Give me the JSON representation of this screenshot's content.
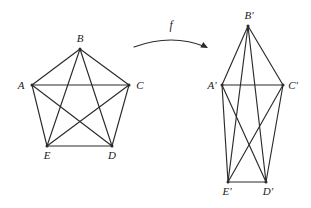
{
  "figure": {
    "type": "graph-isomorphism-diagram",
    "background_color": "#ffffff",
    "stroke_color": "#2b2b2b",
    "label_color": "#1a1a1a"
  },
  "mapping": {
    "label": "f",
    "arrow_name": "curved-mapping-arrow",
    "direction": "left-to-right",
    "curve": {
      "start_x": 134,
      "start_y": 47,
      "control_x": 172,
      "control_y": 33,
      "end_x": 206,
      "end_y": 47
    },
    "head": {
      "x": 208,
      "y": 48,
      "angle_deg": 28
    },
    "label_x": 171,
    "label_y": 29
  },
  "left_graph": {
    "name": "pentagon-complete-graph-K5",
    "vertices": [
      {
        "id": "A",
        "label": "A",
        "x": 32,
        "y": 85,
        "label_x": 21,
        "label_y": 89
      },
      {
        "id": "B",
        "label": "B",
        "x": 80,
        "y": 49,
        "label_x": 80,
        "label_y": 42
      },
      {
        "id": "C",
        "label": "C",
        "x": 129,
        "y": 85,
        "label_x": 140,
        "label_y": 89
      },
      {
        "id": "D",
        "label": "D",
        "x": 112,
        "y": 146,
        "label_x": 112,
        "label_y": 159
      },
      {
        "id": "E",
        "label": "E",
        "x": 47,
        "y": 146,
        "label_x": 47,
        "label_y": 159
      }
    ],
    "edges": [
      [
        "A",
        "B"
      ],
      [
        "B",
        "C"
      ],
      [
        "C",
        "D"
      ],
      [
        "D",
        "E"
      ],
      [
        "E",
        "A"
      ],
      [
        "A",
        "C"
      ],
      [
        "A",
        "D"
      ],
      [
        "B",
        "D"
      ],
      [
        "B",
        "E"
      ],
      [
        "C",
        "E"
      ]
    ]
  },
  "right_graph": {
    "name": "elongated-complete-graph-K5",
    "vertices": [
      {
        "id": "A'",
        "label": "A'",
        "x": 222,
        "y": 85,
        "label_x": 212,
        "label_y": 89
      },
      {
        "id": "B'",
        "label": "B'",
        "x": 248,
        "y": 26,
        "label_x": 249,
        "label_y": 19
      },
      {
        "id": "C'",
        "label": "C'",
        "x": 283,
        "y": 85,
        "label_x": 293,
        "label_y": 89
      },
      {
        "id": "D'",
        "label": "D'",
        "x": 266,
        "y": 182,
        "label_x": 268,
        "label_y": 195
      },
      {
        "id": "E'",
        "label": "E'",
        "x": 228,
        "y": 182,
        "label_x": 227,
        "label_y": 195
      }
    ],
    "edges": [
      [
        "A'",
        "B'"
      ],
      [
        "B'",
        "C'"
      ],
      [
        "C'",
        "D'"
      ],
      [
        "D'",
        "E'"
      ],
      [
        "E'",
        "A'"
      ],
      [
        "A'",
        "C'"
      ],
      [
        "A'",
        "D'"
      ],
      [
        "B'",
        "D'"
      ],
      [
        "B'",
        "E'"
      ],
      [
        "C'",
        "E'"
      ]
    ]
  }
}
